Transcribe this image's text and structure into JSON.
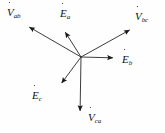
{
  "figure": {
    "background_color": "#fefefe",
    "stroke_color": "#1a1a1a",
    "origin": {
      "x": 81,
      "y": 57
    }
  },
  "chart_data": {
    "type": "scatter",
    "xlabel": "",
    "ylabel": "",
    "grid": false,
    "legend": "none",
    "origin": {
      "x": 81,
      "y": 57
    },
    "vectors": [
      {
        "name": "V_ab",
        "symbol": "V",
        "subscript": "ab",
        "has_dot": true,
        "kind": "line-voltage",
        "tip": {
          "x": 24,
          "y": 24
        },
        "angle_deg": 149.9,
        "length_px": 65.5,
        "label_pos": {
          "x": 7,
          "y": 3
        }
      },
      {
        "name": "E_a",
        "symbol": "E",
        "subscript": "a",
        "has_dot": true,
        "kind": "phase-emf",
        "tip": {
          "x": 62,
          "y": 27
        },
        "angle_deg": 122.3,
        "length_px": 35.5,
        "label_pos": {
          "x": 60,
          "y": 4
        }
      },
      {
        "name": "V_bc",
        "symbol": "V",
        "subscript": "bc",
        "has_dot": true,
        "kind": "line-voltage",
        "tip": {
          "x": 135,
          "y": 27
        },
        "angle_deg": 29.0,
        "length_px": 61.8,
        "label_pos": {
          "x": 135,
          "y": 7
        }
      },
      {
        "name": "E_b",
        "symbol": "E",
        "subscript": "b",
        "has_dot": true,
        "kind": "phase-emf",
        "tip": {
          "x": 119,
          "y": 58
        },
        "angle_deg": -1.5,
        "length_px": 38.0,
        "label_pos": {
          "x": 122,
          "y": 50
        }
      },
      {
        "name": "E_c",
        "symbol": "E",
        "subscript": "c",
        "has_dot": true,
        "kind": "phase-emf",
        "tip": {
          "x": 58,
          "y": 88
        },
        "angle_deg": -126.6,
        "length_px": 38.6,
        "label_pos": {
          "x": 32,
          "y": 86
        }
      },
      {
        "name": "V_ca",
        "symbol": "V",
        "subscript": "ca",
        "has_dot": true,
        "kind": "line-voltage",
        "tip": {
          "x": 80,
          "y": 117
        },
        "angle_deg": -90.9,
        "length_px": 60.0,
        "label_pos": {
          "x": 88,
          "y": 108
        }
      }
    ]
  },
  "labels": {
    "v_ab": {
      "symbol": "V",
      "subscript": "ab"
    },
    "e_a": {
      "symbol": "E",
      "subscript": "a"
    },
    "v_bc": {
      "symbol": "V",
      "subscript": "bc"
    },
    "e_b": {
      "symbol": "E",
      "subscript": "b"
    },
    "e_c": {
      "symbol": "E",
      "subscript": "c"
    },
    "v_ca": {
      "symbol": "V",
      "subscript": "ca"
    }
  }
}
